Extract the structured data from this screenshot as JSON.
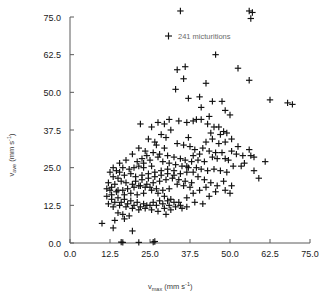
{
  "chart_data": {
    "type": "scatter",
    "title": "",
    "xlabel": "v_max (mm s^-1)",
    "ylabel": "v_ave (mm s^-1)",
    "xlabel_base": "v",
    "xlabel_sub": "max",
    "xlabel_unit": "(mm s",
    "xlabel_exp": "-1",
    "xlabel_close": ")",
    "ylabel_base": "v",
    "ylabel_sub": "ave",
    "ylabel_unit": "(mm s",
    "ylabel_exp": "-1",
    "ylabel_close": ")",
    "xlim": [
      0,
      75
    ],
    "ylim": [
      0,
      75
    ],
    "xticks": [
      "0.0",
      "12.5",
      "25.0",
      "37.5",
      "50.0",
      "62.5",
      "75.0"
    ],
    "yticks": [
      "0.0",
      "12.5",
      "25.0",
      "37.5",
      "50.0",
      "62.5",
      "75.0"
    ],
    "xtick_values": [
      0,
      12.5,
      25,
      37.5,
      50,
      62.5,
      75
    ],
    "ytick_values": [
      0,
      12.5,
      25,
      37.5,
      50,
      62.5,
      75
    ],
    "grid": false,
    "marker": "plus",
    "marker_color": "#111111",
    "legend": {
      "position": "upper-center",
      "entries": [
        {
          "label": "241 micturitions",
          "marker": "plus",
          "n": 241
        }
      ]
    },
    "n_points": 241,
    "points": [
      [
        34.5,
        77.0
      ],
      [
        56.0,
        77.0
      ],
      [
        57.0,
        76.5
      ],
      [
        56.5,
        74.5
      ],
      [
        45.5,
        62.5
      ],
      [
        36.0,
        58.5
      ],
      [
        52.5,
        58.0
      ],
      [
        33.5,
        57.5
      ],
      [
        56.0,
        54.0
      ],
      [
        35.5,
        54.5
      ],
      [
        33.0,
        51.0
      ],
      [
        42.5,
        53.0
      ],
      [
        22.0,
        39.5
      ],
      [
        40.5,
        48.5
      ],
      [
        44.5,
        47.0
      ],
      [
        47.5,
        47.0
      ],
      [
        37.0,
        48.0
      ],
      [
        41.0,
        45.0
      ],
      [
        62.5,
        47.5
      ],
      [
        68.0,
        46.5
      ],
      [
        69.5,
        46.0
      ],
      [
        48.5,
        44.0
      ],
      [
        50.0,
        42.5
      ],
      [
        43.5,
        42.0
      ],
      [
        39.5,
        41.0
      ],
      [
        41.0,
        41.0
      ],
      [
        34.0,
        40.5
      ],
      [
        36.5,
        40.0
      ],
      [
        38.5,
        40.5
      ],
      [
        43.0,
        39.5
      ],
      [
        45.0,
        38.5
      ],
      [
        46.5,
        38.5
      ],
      [
        48.0,
        37.0
      ],
      [
        49.0,
        36.5
      ],
      [
        47.0,
        36.0
      ],
      [
        44.0,
        36.5
      ],
      [
        31.5,
        37.5
      ],
      [
        28.5,
        36.0
      ],
      [
        30.0,
        35.0
      ],
      [
        26.5,
        33.5
      ],
      [
        24.5,
        34.5
      ],
      [
        27.0,
        32.5
      ],
      [
        29.5,
        31.5
      ],
      [
        33.5,
        33.0
      ],
      [
        35.5,
        32.5
      ],
      [
        37.5,
        32.0
      ],
      [
        39.0,
        31.0
      ],
      [
        41.5,
        31.5
      ],
      [
        43.5,
        30.5
      ],
      [
        45.5,
        30.0
      ],
      [
        47.5,
        30.0
      ],
      [
        50.5,
        30.5
      ],
      [
        52.0,
        29.5
      ],
      [
        54.0,
        29.0
      ],
      [
        56.5,
        29.0
      ],
      [
        44.5,
        28.5
      ],
      [
        46.0,
        28.0
      ],
      [
        48.5,
        28.0
      ],
      [
        49.5,
        27.5
      ],
      [
        42.0,
        27.0
      ],
      [
        40.0,
        27.5
      ],
      [
        38.0,
        27.0
      ],
      [
        36.0,
        27.5
      ],
      [
        34.5,
        28.0
      ],
      [
        32.5,
        28.5
      ],
      [
        30.5,
        29.0
      ],
      [
        28.0,
        29.5
      ],
      [
        26.0,
        30.0
      ],
      [
        24.0,
        29.0
      ],
      [
        22.5,
        28.0
      ],
      [
        21.0,
        27.0
      ],
      [
        23.0,
        26.5
      ],
      [
        25.0,
        27.5
      ],
      [
        27.5,
        28.5
      ],
      [
        29.0,
        27.0
      ],
      [
        31.0,
        26.5
      ],
      [
        33.0,
        26.0
      ],
      [
        35.0,
        25.5
      ],
      [
        37.0,
        25.0
      ],
      [
        39.5,
        25.0
      ],
      [
        41.0,
        24.5
      ],
      [
        43.0,
        24.0
      ],
      [
        45.0,
        24.5
      ],
      [
        47.0,
        24.0
      ],
      [
        49.0,
        23.5
      ],
      [
        51.0,
        25.5
      ],
      [
        53.5,
        25.5
      ],
      [
        57.5,
        24.0
      ],
      [
        61.0,
        27.0
      ],
      [
        59.0,
        21.5
      ],
      [
        48.0,
        20.5
      ],
      [
        50.5,
        19.0
      ],
      [
        42.5,
        18.5
      ],
      [
        40.5,
        17.5
      ],
      [
        38.5,
        16.5
      ],
      [
        36.5,
        15.0
      ],
      [
        34.0,
        13.5
      ],
      [
        31.5,
        14.5
      ],
      [
        29.5,
        15.5
      ],
      [
        27.5,
        16.5
      ],
      [
        25.5,
        17.5
      ],
      [
        23.5,
        18.5
      ],
      [
        21.5,
        19.0
      ],
      [
        19.5,
        19.5
      ],
      [
        17.5,
        20.0
      ],
      [
        16.0,
        20.5
      ],
      [
        15.0,
        21.5
      ],
      [
        14.0,
        19.5
      ],
      [
        13.0,
        18.5
      ],
      [
        12.5,
        17.5
      ],
      [
        14.5,
        17.0
      ],
      [
        16.5,
        17.5
      ],
      [
        18.0,
        18.0
      ],
      [
        20.0,
        18.5
      ],
      [
        22.0,
        19.0
      ],
      [
        24.0,
        19.5
      ],
      [
        26.0,
        20.0
      ],
      [
        28.0,
        20.5
      ],
      [
        30.0,
        21.0
      ],
      [
        32.0,
        21.5
      ],
      [
        34.0,
        21.0
      ],
      [
        36.0,
        20.5
      ],
      [
        38.0,
        20.0
      ],
      [
        20.5,
        22.0
      ],
      [
        22.5,
        22.5
      ],
      [
        24.5,
        23.0
      ],
      [
        26.5,
        23.5
      ],
      [
        28.5,
        24.0
      ],
      [
        30.5,
        24.5
      ],
      [
        32.5,
        24.0
      ],
      [
        19.0,
        23.0
      ],
      [
        17.0,
        22.5
      ],
      [
        15.5,
        23.5
      ],
      [
        18.5,
        24.5
      ],
      [
        20.0,
        25.0
      ],
      [
        21.5,
        25.5
      ],
      [
        23.0,
        25.0
      ],
      [
        25.5,
        25.5
      ],
      [
        16.5,
        25.0
      ],
      [
        14.5,
        24.0
      ],
      [
        13.5,
        22.0
      ],
      [
        12.0,
        20.0
      ],
      [
        11.5,
        18.0
      ],
      [
        13.0,
        16.0
      ],
      [
        15.0,
        15.0
      ],
      [
        17.0,
        14.5
      ],
      [
        19.0,
        14.0
      ],
      [
        21.0,
        13.5
      ],
      [
        23.0,
        13.0
      ],
      [
        25.0,
        12.5
      ],
      [
        27.0,
        12.5
      ],
      [
        29.0,
        13.0
      ],
      [
        31.0,
        12.5
      ],
      [
        33.0,
        12.0
      ],
      [
        35.0,
        11.5
      ],
      [
        30.0,
        9.5
      ],
      [
        27.5,
        10.5
      ],
      [
        25.5,
        11.0
      ],
      [
        23.5,
        11.5
      ],
      [
        21.5,
        11.0
      ],
      [
        19.5,
        11.5
      ],
      [
        17.5,
        12.0
      ],
      [
        15.5,
        12.5
      ],
      [
        13.5,
        12.0
      ],
      [
        12.0,
        13.0
      ],
      [
        14.0,
        13.5
      ],
      [
        16.0,
        13.5
      ],
      [
        18.0,
        13.0
      ],
      [
        20.0,
        12.5
      ],
      [
        22.0,
        12.0
      ],
      [
        24.0,
        12.5
      ],
      [
        26.0,
        13.5
      ],
      [
        28.0,
        14.0
      ],
      [
        30.5,
        14.0
      ],
      [
        32.5,
        13.5
      ],
      [
        34.5,
        12.5
      ],
      [
        36.5,
        12.0
      ],
      [
        31.5,
        11.0
      ],
      [
        29.5,
        11.5
      ],
      [
        15.0,
        10.0
      ],
      [
        16.5,
        9.5
      ],
      [
        18.5,
        9.0
      ],
      [
        17.0,
        8.0
      ],
      [
        14.0,
        7.5
      ],
      [
        10.0,
        6.5
      ],
      [
        13.5,
        5.0
      ],
      [
        19.5,
        4.0
      ],
      [
        16.0,
        0.3
      ],
      [
        21.5,
        0.2
      ],
      [
        26.5,
        0.5
      ],
      [
        16.5,
        0.2
      ],
      [
        26.0,
        0.3
      ],
      [
        36.5,
        25.5
      ],
      [
        38.5,
        23.5
      ],
      [
        40.0,
        22.0
      ],
      [
        42.0,
        21.0
      ],
      [
        44.0,
        20.0
      ],
      [
        46.0,
        19.0
      ],
      [
        48.5,
        17.5
      ],
      [
        50.0,
        16.5
      ],
      [
        39.0,
        13.5
      ],
      [
        41.5,
        13.0
      ],
      [
        43.5,
        15.5
      ],
      [
        45.5,
        17.0
      ],
      [
        33.5,
        19.5
      ],
      [
        35.5,
        19.0
      ],
      [
        37.5,
        18.5
      ],
      [
        31.0,
        18.0
      ],
      [
        29.0,
        17.5
      ],
      [
        27.0,
        18.0
      ],
      [
        25.0,
        18.5
      ],
      [
        23.0,
        16.5
      ],
      [
        21.0,
        16.0
      ],
      [
        19.0,
        16.5
      ],
      [
        17.0,
        16.0
      ],
      [
        15.0,
        17.5
      ],
      [
        13.0,
        14.5
      ],
      [
        11.5,
        15.5
      ],
      [
        20.5,
        20.5
      ],
      [
        22.5,
        21.0
      ],
      [
        24.5,
        21.5
      ],
      [
        26.5,
        22.0
      ],
      [
        28.5,
        22.5
      ],
      [
        30.5,
        23.0
      ],
      [
        32.5,
        22.5
      ],
      [
        34.5,
        23.0
      ],
      [
        36.5,
        23.5
      ],
      [
        38.5,
        29.0
      ],
      [
        40.5,
        29.5
      ],
      [
        42.5,
        33.5
      ],
      [
        44.5,
        34.5
      ],
      [
        46.5,
        33.0
      ],
      [
        48.5,
        33.5
      ],
      [
        50.5,
        34.5
      ],
      [
        52.5,
        32.0
      ],
      [
        54.5,
        26.5
      ],
      [
        56.0,
        31.0
      ],
      [
        57.5,
        28.5
      ],
      [
        27.5,
        40.0
      ],
      [
        29.5,
        39.5
      ],
      [
        31.0,
        41.0
      ],
      [
        25.5,
        38.5
      ],
      [
        23.5,
        30.5
      ],
      [
        21.5,
        31.5
      ],
      [
        19.5,
        29.5
      ],
      [
        17.5,
        27.5
      ],
      [
        15.5,
        26.5
      ],
      [
        13.5,
        25.0
      ],
      [
        12.5,
        23.5
      ],
      [
        37.0,
        35.0
      ]
    ]
  }
}
